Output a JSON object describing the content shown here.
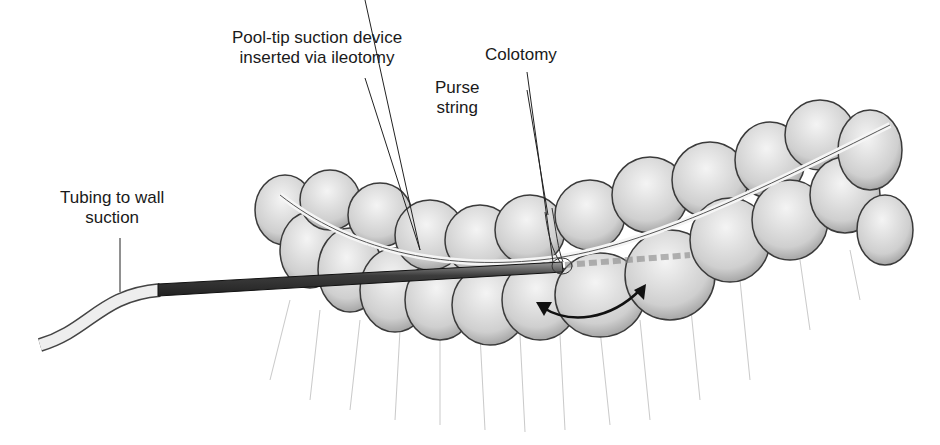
{
  "labels": {
    "pool_tip_line1": "Pool-tip suction device",
    "pool_tip_line2": "inserted via ileotomy",
    "colotomy": "Colotomy",
    "purse_line1": "Purse",
    "purse_line2": "string",
    "tubing_line1": "Tubing to wall",
    "tubing_line2": "suction"
  },
  "colors": {
    "bowel_fill": "#d9d9d9",
    "bowel_stroke": "#3a3a3a",
    "device": "#555555",
    "tubing": "#eeeeee",
    "text": "#1a1a1a"
  }
}
